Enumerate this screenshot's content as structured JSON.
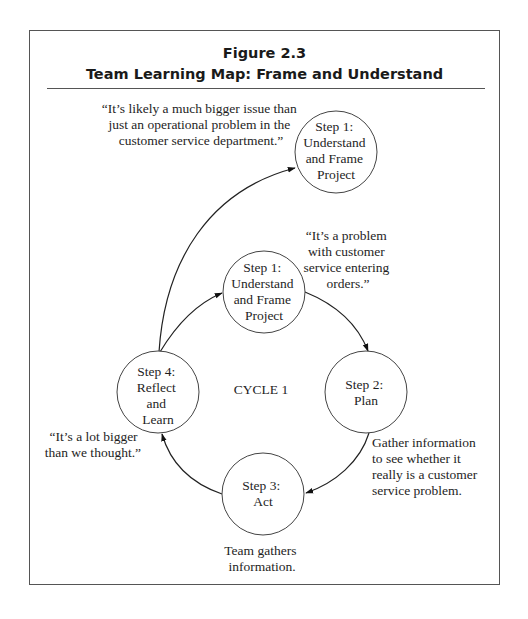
{
  "figure": {
    "number": "Figure 2.3",
    "title": "Team Learning Map: Frame and Understand"
  },
  "colors": {
    "border": "#555555",
    "stroke": "#444444",
    "text": "#1e1e1e",
    "background": "#ffffff"
  },
  "center_label": "CYCLE 1",
  "nodes": [
    {
      "id": "outer-step1",
      "lines": [
        "Step 1:",
        "Understand",
        "and Frame",
        "Project"
      ]
    },
    {
      "id": "step1",
      "lines": [
        "Step 1:",
        "Understand",
        "and Frame",
        "Project"
      ]
    },
    {
      "id": "step2",
      "lines": [
        "Step 2:",
        "Plan"
      ]
    },
    {
      "id": "step3",
      "lines": [
        "Step 3:",
        "Act"
      ]
    },
    {
      "id": "step4",
      "lines": [
        "Step 4:",
        "Reflect",
        "and",
        "Learn"
      ]
    }
  ],
  "annotations": {
    "outer_quote": [
      "“It’s likely a much bigger issue than",
      "just an operational problem in the",
      "customer service department.”"
    ],
    "step1_quote": [
      "“It’s a problem",
      "with customer",
      "service entering",
      "orders.”"
    ],
    "step2_note": [
      "Gather information",
      "to see whether it",
      "really is a customer",
      "service problem."
    ],
    "step3_note": [
      "Team gathers",
      "information."
    ],
    "step4_quote": [
      "“It’s a lot bigger",
      "than we thought.”"
    ]
  },
  "edges": [
    {
      "from": "step4",
      "to": "outer-step1"
    },
    {
      "from": "step4",
      "to": "step1"
    },
    {
      "from": "step1",
      "to": "step2"
    },
    {
      "from": "step2",
      "to": "step3"
    },
    {
      "from": "step3",
      "to": "step4"
    }
  ]
}
